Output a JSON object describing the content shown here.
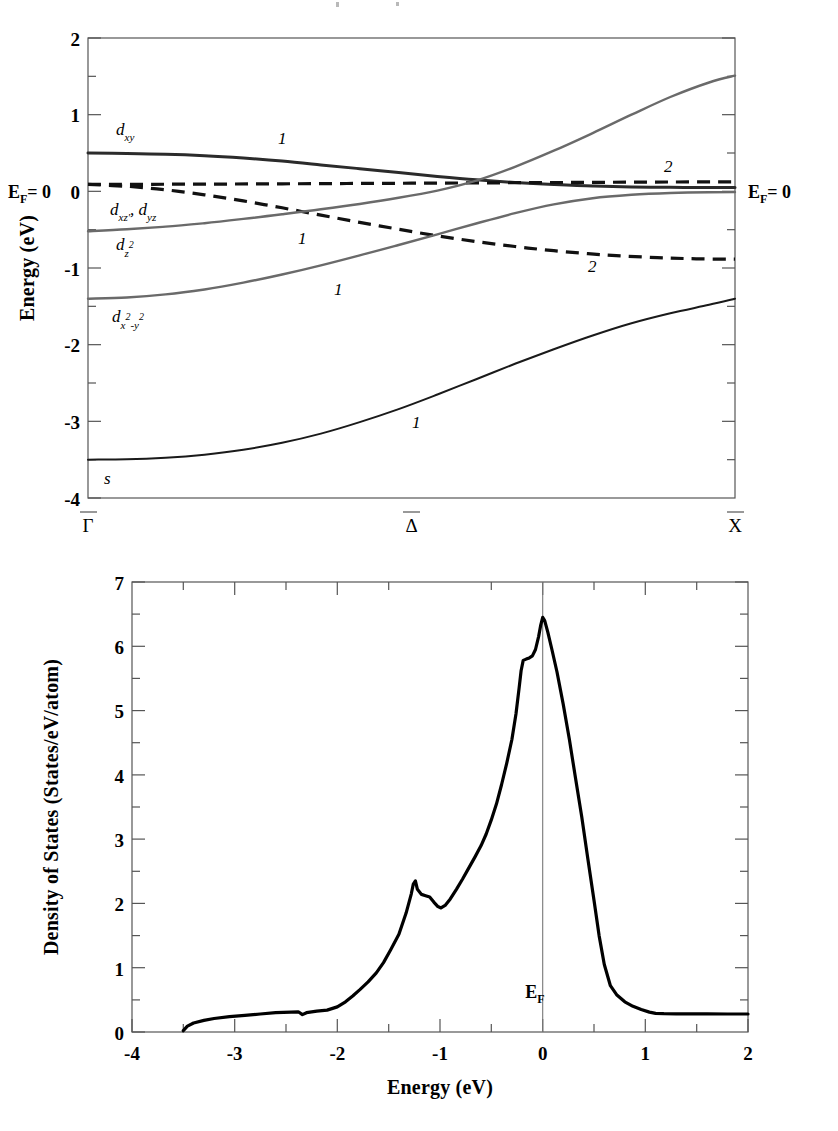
{
  "figure": {
    "panels": [
      {
        "id": "band-structure",
        "name": "Surface band structure"
      },
      {
        "id": "density-of-states",
        "name": "Density of states"
      }
    ]
  },
  "band_panel": {
    "y_axis_title": "Energy (eV)",
    "y_ticks": [
      "2",
      "1",
      "0",
      "-1",
      "-2",
      "-3",
      "-4"
    ],
    "x_tick_labels": [
      "Γ",
      "Δ",
      "X"
    ],
    "fermi_label_left": "E",
    "fermi_label_left_sub": "F",
    "fermi_label_left_eq": "= 0",
    "fermi_label_right": "E",
    "fermi_label_right_sub": "F",
    "fermi_label_right_eq": "= 0",
    "orbital_labels": [
      {
        "base": "d",
        "sub": "xy",
        "sup": ""
      },
      {
        "base": "d",
        "sub": "xz'",
        "sup": ""
      },
      {
        "base": "d",
        "sub": "yz",
        "sup": ""
      },
      {
        "base": "d",
        "sub": "z",
        "sup": "2"
      },
      {
        "base": "d",
        "sub": "x",
        "sup": "2"
      },
      {
        "base": "s",
        "sub": "",
        "sup": ""
      }
    ],
    "orbital_label_text": {
      "dxy": "d",
      "dxy_sub": "xy",
      "dxz_dyz_1": "d",
      "dxz_dyz_1_sub": "xz'",
      "dxz_dyz_2": "d",
      "dxz_dyz_2_sub": "yz",
      "dz2": "d",
      "dz2_sub": "z",
      "dz2_sup": "2",
      "dx2y2": "d",
      "dx2y2_sub_x": "x",
      "dx2y2_sup_x": "2",
      "dx2y2_minus": "-",
      "dx2y2_sub_y": "y",
      "dx2y2_sup_y": "2",
      "s": "s"
    },
    "band_indices": [
      "1",
      "1",
      "1",
      "1",
      "2",
      "2"
    ]
  },
  "dos_panel": {
    "y_axis_title": "Density of States  (States/eV/atom)",
    "x_axis_title": "Energy (eV)",
    "y_ticks": [
      "7",
      "6",
      "5",
      "4",
      "3",
      "2",
      "1",
      "0"
    ],
    "x_ticks": [
      "-4",
      "-3",
      "-2",
      "-1",
      "0",
      "1",
      "2"
    ],
    "fermi_marker": "E",
    "fermi_marker_sub": "F"
  },
  "colors": {
    "frame": "#555555",
    "curve_dark": "#2b2b2b",
    "curve_gray": "#6a6a6a",
    "curve_black": "#000000",
    "background": "#ffffff"
  },
  "chart_data": [
    {
      "type": "line",
      "title": "Surface band structure along Γ-Δ-X",
      "xlabel": "",
      "ylabel": "Energy (eV)",
      "xlim": [
        0,
        1
      ],
      "ylim": [
        -4,
        2
      ],
      "grid": false,
      "legend": "none",
      "x_tick_positions": [
        0,
        0.5,
        1
      ],
      "x_tick_labels": [
        "Γ̄",
        "Δ̄",
        "X̄"
      ],
      "y_tick_values": [
        2,
        1,
        0,
        -1,
        -2,
        -3,
        -4
      ],
      "annotations": [
        {
          "text": "d_xy",
          "x": 0.07,
          "y": 0.92
        },
        {
          "text": "d_xz', d_yz",
          "x": 0.06,
          "y": -0.22
        },
        {
          "text": "d_z2",
          "x": 0.07,
          "y": -0.68
        },
        {
          "text": "d_x2-y2",
          "x": 0.06,
          "y": -1.62
        },
        {
          "text": "s",
          "x": 0.045,
          "y": -3.78
        },
        {
          "text": "1",
          "x": 0.3,
          "y": 0.72
        },
        {
          "text": "1",
          "x": 0.33,
          "y": -0.66
        },
        {
          "text": "1",
          "x": 0.38,
          "y": -1.17
        },
        {
          "text": "1",
          "x": 0.5,
          "y": -3.13
        },
        {
          "text": "2",
          "x": 0.79,
          "y": 0.45
        },
        {
          "text": "2",
          "x": 0.7,
          "y": -0.7
        }
      ],
      "series": [
        {
          "name": "d_xy",
          "style": "solid",
          "color": "#2b2b2b",
          "x": [
            0.0,
            0.06,
            0.12,
            0.18,
            0.24,
            0.3,
            0.36,
            0.42,
            0.48,
            0.54,
            0.6,
            0.66,
            0.72,
            0.78,
            0.84,
            0.9,
            0.96,
            1.0
          ],
          "y": [
            0.5,
            0.495,
            0.485,
            0.465,
            0.435,
            0.395,
            0.345,
            0.295,
            0.245,
            0.195,
            0.15,
            0.115,
            0.09,
            0.07,
            0.058,
            0.052,
            0.05,
            0.05
          ]
        },
        {
          "name": "d_xz,d_yz (upper, band 2)",
          "style": "dashed",
          "color": "#111111",
          "x": [
            0.0,
            0.1,
            0.2,
            0.3,
            0.4,
            0.5,
            0.6,
            0.7,
            0.8,
            0.9,
            1.0
          ],
          "y": [
            0.09,
            0.092,
            0.095,
            0.098,
            0.102,
            0.106,
            0.11,
            0.114,
            0.118,
            0.122,
            0.125
          ]
        },
        {
          "name": "d_xz,d_yz (lower, band 2)",
          "style": "dashed",
          "color": "#111111",
          "x": [
            0.0,
            0.06,
            0.12,
            0.18,
            0.24,
            0.3,
            0.36,
            0.42,
            0.48,
            0.54,
            0.6,
            0.66,
            0.72,
            0.8,
            0.88,
            0.94,
            1.0
          ],
          "y": [
            0.09,
            0.065,
            0.02,
            -0.045,
            -0.125,
            -0.215,
            -0.31,
            -0.405,
            -0.495,
            -0.58,
            -0.655,
            -0.72,
            -0.775,
            -0.83,
            -0.865,
            -0.88,
            -0.885
          ]
        },
        {
          "name": "d_z2",
          "style": "solid",
          "color": "#6a6a6a",
          "x": [
            0.0,
            0.06,
            0.12,
            0.18,
            0.24,
            0.3,
            0.36,
            0.42,
            0.48,
            0.54,
            0.6,
            0.66,
            0.72,
            0.78,
            0.84,
            0.9,
            0.96,
            1.0
          ],
          "y": [
            -0.52,
            -0.495,
            -0.46,
            -0.415,
            -0.36,
            -0.3,
            -0.235,
            -0.165,
            -0.085,
            0.01,
            0.14,
            0.32,
            0.53,
            0.76,
            1.0,
            1.23,
            1.42,
            1.51
          ]
        },
        {
          "name": "d_x2-y2",
          "style": "solid",
          "color": "#6a6a6a",
          "x": [
            0.0,
            0.06,
            0.12,
            0.18,
            0.24,
            0.3,
            0.36,
            0.42,
            0.48,
            0.54,
            0.6,
            0.66,
            0.72,
            0.78,
            0.84,
            0.9,
            0.96,
            1.0
          ],
          "y": [
            -1.4,
            -1.385,
            -1.345,
            -1.28,
            -1.19,
            -1.085,
            -0.965,
            -0.835,
            -0.7,
            -0.56,
            -0.42,
            -0.285,
            -0.17,
            -0.09,
            -0.045,
            -0.022,
            -0.012,
            -0.01
          ]
        },
        {
          "name": "s",
          "style": "solid",
          "color": "#1a1a1a",
          "x": [
            0.0,
            0.06,
            0.12,
            0.18,
            0.24,
            0.3,
            0.36,
            0.42,
            0.48,
            0.54,
            0.6,
            0.66,
            0.72,
            0.78,
            0.84,
            0.9,
            0.96,
            1.0
          ],
          "y": [
            -3.5,
            -3.495,
            -3.475,
            -3.435,
            -3.37,
            -3.28,
            -3.16,
            -3.01,
            -2.84,
            -2.65,
            -2.45,
            -2.25,
            -2.06,
            -1.88,
            -1.72,
            -1.59,
            -1.48,
            -1.4
          ]
        }
      ]
    },
    {
      "type": "line",
      "title": "Density of States",
      "xlabel": "Energy (eV)",
      "ylabel": "Density of States  (States/eV/atom)",
      "xlim": [
        -4,
        2
      ],
      "ylim": [
        0,
        7
      ],
      "grid": false,
      "legend": "none",
      "x_tick_values": [
        -4,
        -3,
        -2,
        -1,
        0,
        1,
        2
      ],
      "y_tick_values": [
        0,
        1,
        2,
        3,
        4,
        5,
        6,
        7
      ],
      "annotations": [
        {
          "text": "E_F",
          "x": 0.0,
          "y": 0.52
        }
      ],
      "vertical_lines": [
        {
          "x": 0.0,
          "label": "E_F"
        }
      ],
      "series": [
        {
          "name": "Total DOS",
          "style": "solid",
          "color": "#000000",
          "x": [
            -3.5,
            -3.46,
            -3.4,
            -3.3,
            -3.2,
            -3.05,
            -2.9,
            -2.75,
            -2.6,
            -2.45,
            -2.38,
            -2.34,
            -2.3,
            -2.2,
            -2.1,
            -2.0,
            -1.92,
            -1.85,
            -1.78,
            -1.7,
            -1.62,
            -1.55,
            -1.48,
            -1.4,
            -1.33,
            -1.28,
            -1.26,
            -1.24,
            -1.22,
            -1.18,
            -1.14,
            -1.1,
            -1.06,
            -1.02,
            -0.99,
            -0.95,
            -0.9,
            -0.84,
            -0.78,
            -0.72,
            -0.66,
            -0.6,
            -0.55,
            -0.5,
            -0.45,
            -0.4,
            -0.35,
            -0.3,
            -0.26,
            -0.23,
            -0.21,
            -0.19,
            -0.16,
            -0.13,
            -0.1,
            -0.07,
            -0.04,
            -0.02,
            0.0,
            0.02,
            0.05,
            0.09,
            0.14,
            0.2,
            0.26,
            0.32,
            0.38,
            0.44,
            0.5,
            0.55,
            0.6,
            0.66,
            0.72,
            0.8,
            0.88,
            0.96,
            1.04,
            1.1,
            1.18,
            1.3,
            1.45,
            1.6,
            1.8,
            2.0
          ],
          "y": [
            0.02,
            0.09,
            0.14,
            0.18,
            0.21,
            0.24,
            0.26,
            0.28,
            0.3,
            0.31,
            0.315,
            0.27,
            0.3,
            0.325,
            0.34,
            0.39,
            0.47,
            0.56,
            0.66,
            0.78,
            0.92,
            1.08,
            1.28,
            1.52,
            1.85,
            2.15,
            2.3,
            2.35,
            2.22,
            2.14,
            2.12,
            2.1,
            2.02,
            1.95,
            1.93,
            1.97,
            2.07,
            2.22,
            2.38,
            2.55,
            2.72,
            2.9,
            3.08,
            3.3,
            3.55,
            3.85,
            4.18,
            4.55,
            4.95,
            5.35,
            5.62,
            5.78,
            5.8,
            5.82,
            5.85,
            5.95,
            6.15,
            6.32,
            6.45,
            6.4,
            6.22,
            5.95,
            5.6,
            5.1,
            4.55,
            3.95,
            3.35,
            2.7,
            2.05,
            1.5,
            1.05,
            0.72,
            0.58,
            0.47,
            0.4,
            0.35,
            0.31,
            0.29,
            0.285,
            0.283,
            0.282,
            0.281,
            0.28,
            0.28
          ]
        }
      ]
    }
  ]
}
